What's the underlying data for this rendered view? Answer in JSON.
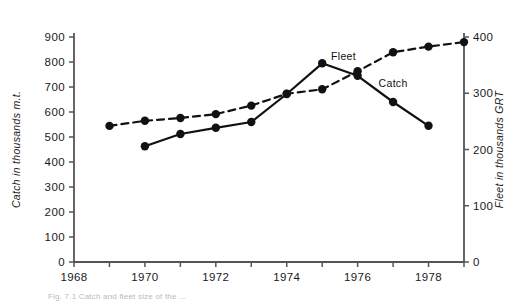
{
  "figure": {
    "background_color": "#ffffff",
    "ink_color": "#111111",
    "caption": "Fig. 7.1 Catch and fleet size of the ..."
  },
  "chart_data": {
    "type": "line",
    "title": "",
    "xlabel": "",
    "ylabel": "Catch in thousands m.t.",
    "y2label": "Fleet in thousands GRT",
    "xlim": [
      1968,
      1979
    ],
    "ylim": [
      0,
      900
    ],
    "y2lim": [
      0,
      400
    ],
    "grid": false,
    "legend": "inline-annotation",
    "x_ticks": [
      1968,
      1969,
      1970,
      1971,
      1972,
      1973,
      1974,
      1975,
      1976,
      1977,
      1978,
      1979
    ],
    "x_tick_labels": [
      "1968",
      "",
      "1970",
      "",
      "1972",
      "",
      "1974",
      "",
      "1976",
      "",
      "1978",
      ""
    ],
    "y_ticks": [
      0,
      100,
      200,
      300,
      400,
      500,
      600,
      700,
      800,
      900
    ],
    "y_tick_labels": [
      "0",
      "100",
      "200",
      "300",
      "400",
      "500",
      "600",
      "700",
      "800",
      "900"
    ],
    "y2_ticks": [
      0,
      100,
      200,
      300,
      400
    ],
    "y2_tick_labels": [
      "0",
      "100",
      "200",
      "300",
      "400"
    ],
    "series": [
      {
        "name": "Catch",
        "label": "Catch",
        "axis": "left",
        "style": "solid",
        "marker": "filled-circle",
        "color": "#111111",
        "x": [
          1970,
          1971,
          1972,
          1973,
          1974,
          1975,
          1976,
          1977,
          1978
        ],
        "values": [
          463,
          512,
          537,
          560,
          672,
          795,
          745,
          640,
          545
        ],
        "label_x": 1977.0,
        "label_y": 700
      },
      {
        "name": "Fleet",
        "label": "Fleet",
        "axis": "right",
        "style": "dashed",
        "marker": "filled-circle",
        "color": "#111111",
        "x": [
          1969,
          1970,
          1971,
          1972,
          1973,
          1974,
          1975,
          1976,
          1977,
          1978,
          1979
        ],
        "values": [
          242,
          251,
          256,
          263,
          278,
          299,
          307,
          339,
          373,
          383,
          391
        ],
        "label_x": 1975.6,
        "label_y": 360
      }
    ]
  }
}
